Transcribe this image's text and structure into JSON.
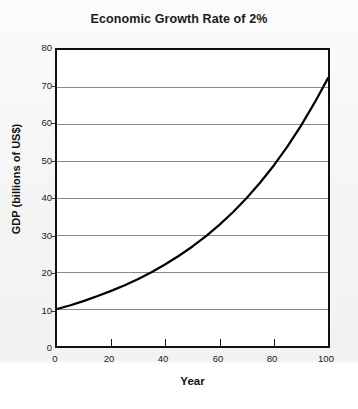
{
  "chart_data": {
    "type": "line",
    "title": "Economic Growth Rate of 2%",
    "xlabel": "Year",
    "ylabel": "GDP (billions of US$)",
    "xlim": [
      0,
      100
    ],
    "ylim": [
      0,
      80
    ],
    "xticks": [
      0,
      20,
      40,
      60,
      80,
      100
    ],
    "yticks": [
      0,
      10,
      20,
      30,
      40,
      50,
      60,
      70,
      80
    ],
    "grid": "horizontal",
    "legend": "none",
    "series": [
      {
        "name": "GDP at 2% growth",
        "formula": "10 * 1.02^t",
        "color": "#000000",
        "x": [
          0,
          5,
          10,
          15,
          20,
          25,
          30,
          35,
          40,
          45,
          50,
          55,
          60,
          65,
          70,
          75,
          80,
          85,
          90,
          95,
          100
        ],
        "values": [
          10.0,
          11.0,
          12.2,
          13.5,
          14.9,
          16.4,
          18.1,
          20.0,
          22.1,
          24.4,
          26.9,
          29.7,
          32.8,
          36.2,
          40.0,
          44.2,
          48.8,
          53.9,
          59.5,
          65.7,
          72.4
        ]
      }
    ]
  }
}
